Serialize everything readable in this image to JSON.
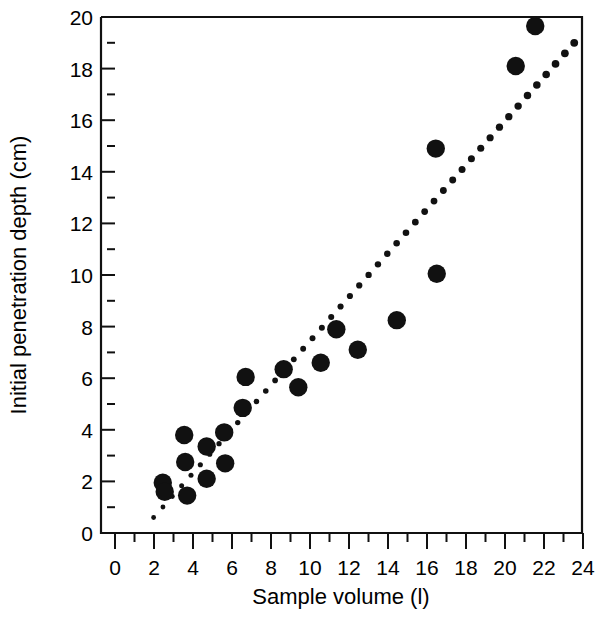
{
  "chart_data": {
    "type": "scatter",
    "title": "",
    "xlabel": "Sample volume (l)",
    "ylabel": "Initial penetration depth (cm)",
    "xlim": [
      0,
      24
    ],
    "ylim": [
      0,
      20
    ],
    "xticks": [
      0,
      2,
      4,
      6,
      8,
      10,
      12,
      14,
      16,
      18,
      20,
      22,
      24
    ],
    "yticks": [
      0,
      2,
      4,
      6,
      8,
      10,
      12,
      14,
      16,
      18,
      20
    ],
    "xtick_labels": [
      "0",
      "2",
      "4",
      "6",
      "8",
      "10",
      "12",
      "14",
      "16",
      "18",
      "20",
      "22",
      "24"
    ],
    "ytick_labels": [
      "0",
      "2",
      "4",
      "6",
      "8",
      "10",
      "12",
      "14",
      "16",
      "18",
      "20"
    ],
    "minor_ticks": true,
    "grid": false,
    "legend": null,
    "marker": "filled-circle",
    "marker_color": "#111111",
    "series": [
      {
        "name": "Observations",
        "points": [
          [
            2.45,
            1.95
          ],
          [
            2.55,
            1.6
          ],
          [
            3.55,
            3.8
          ],
          [
            3.6,
            2.75
          ],
          [
            3.7,
            1.45
          ],
          [
            4.7,
            3.35
          ],
          [
            4.7,
            2.1
          ],
          [
            5.6,
            3.9
          ],
          [
            5.65,
            2.7
          ],
          [
            6.55,
            4.85
          ],
          [
            6.7,
            6.05
          ],
          [
            8.65,
            6.35
          ],
          [
            9.4,
            5.65
          ],
          [
            10.55,
            6.6
          ],
          [
            11.35,
            7.9
          ],
          [
            12.45,
            7.1
          ],
          [
            14.45,
            8.25
          ],
          [
            16.45,
            14.9
          ],
          [
            16.5,
            10.05
          ],
          [
            20.55,
            18.1
          ],
          [
            21.55,
            19.65
          ]
        ]
      }
    ],
    "trendline": {
      "style": "dotted",
      "x_start": 1.98,
      "y_start": 0.6,
      "x_end": 23.55,
      "y_end": 19.0,
      "dot_count": 46,
      "color": "#111111"
    }
  },
  "axes": {
    "x_axis_name": "sample-volume-axis",
    "y_axis_name": "penetration-depth-axis"
  }
}
